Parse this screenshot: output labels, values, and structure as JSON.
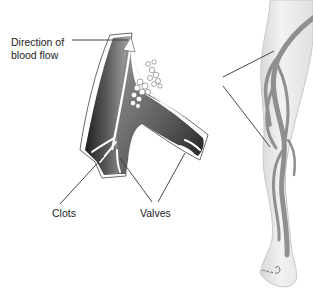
{
  "diagram": {
    "type": "anatomical illustration",
    "labels": {
      "direction_line1": "Direction of",
      "direction_line2": "blood flow",
      "clots": "Clots",
      "valves": "Valves"
    },
    "elements": [
      {
        "name": "vein-cross-section",
        "description": "Branching vein segment (Y-shape) showing blood flow arrow, clots and valve flaps"
      },
      {
        "name": "leg-illustration",
        "description": "Lower leg and foot with superficial veins highlighted in gray"
      },
      {
        "name": "zoom-callout-lines",
        "description": "Two lines linking the vein detail to the leg"
      }
    ],
    "colors": {
      "vein_dark": "#2a2a2a",
      "vein_mid": "#6a6a6a",
      "vein_light": "#b5b5b5",
      "leg_skin": "#ececec",
      "leg_outline": "#c8c8c8",
      "leg_veins": "#8f8f8f",
      "leader_lines": "#333333",
      "text": "#222222"
    }
  }
}
